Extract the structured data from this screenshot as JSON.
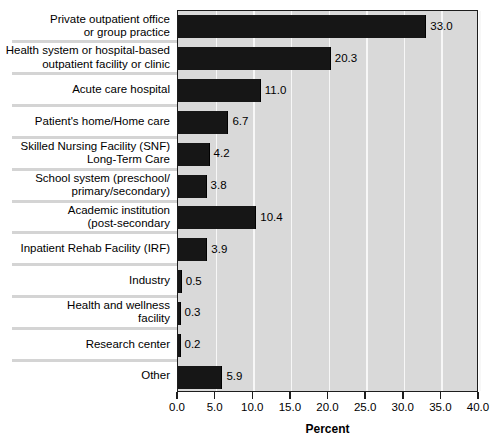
{
  "chart_data": {
    "type": "bar",
    "orientation": "horizontal",
    "title": "",
    "xlabel": "Percent",
    "ylabel": "",
    "xlim": [
      0.0,
      40.0
    ],
    "xticks": [
      "0.0",
      "5.0",
      "10.0",
      "15.0",
      "20.0",
      "25.0",
      "30.0",
      "35.0",
      "40.0"
    ],
    "xtick_values": [
      0.0,
      5.0,
      10.0,
      15.0,
      20.0,
      25.0,
      30.0,
      35.0,
      40.0
    ],
    "grid": "vertical-gridlines-at-xticks",
    "legend": "none",
    "categories": [
      "Private outpatient office\nor group practice",
      "Health system or hospital-based\noutpatient facility or clinic",
      "Acute care hospital",
      "Patient's home/Home care",
      "Skilled Nursing Facility (SNF)\nLong-Term Care",
      "School system (preschool/\nprimary/secondary)",
      "Academic institution\n(post-secondary",
      "Inpatient Rehab Facility (IRF)",
      "Industry",
      "Health and wellness\nfacility",
      "Research center",
      "Other"
    ],
    "values": [
      33.0,
      20.3,
      11.0,
      6.7,
      4.2,
      3.8,
      10.4,
      3.9,
      0.5,
      0.3,
      0.2,
      5.9
    ],
    "value_labels": [
      "33.0",
      "20.3",
      "11.0",
      "6.7",
      "4.2",
      "3.8",
      "10.4",
      "3.9",
      "0.5",
      "0.3",
      "0.2",
      "5.9"
    ],
    "colors": {
      "bar": "#161616",
      "plot_background": "#d9d9d9",
      "gridline": "#f7f7f7",
      "axis": "#1d1d1d",
      "separator": "#d4d4d4",
      "page_background": "#ffffff",
      "text": "#000000"
    }
  }
}
